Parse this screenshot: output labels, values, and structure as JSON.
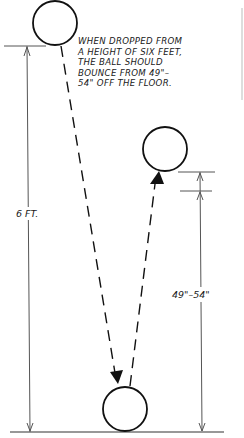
{
  "diagram": {
    "title_note": [
      "WHEN DROPPED FROM",
      "A HEIGHT OF SIX FEET,",
      "THE BALL SHOULD",
      "BOUNCE FROM 49\"–",
      "54\" OFF THE FLOOR."
    ],
    "drop_height_label": "6 FT.",
    "bounce_height_label": "49\"–54\"",
    "elements": {
      "top_ball": "ball at drop height",
      "bounced_ball": "ball at bounce height",
      "floor_ball": "ball on floor",
      "floor_line": "floor"
    },
    "colors": {
      "ink": "#1a1a1a",
      "dim_line": "#555555",
      "background": "#ffffff"
    }
  }
}
